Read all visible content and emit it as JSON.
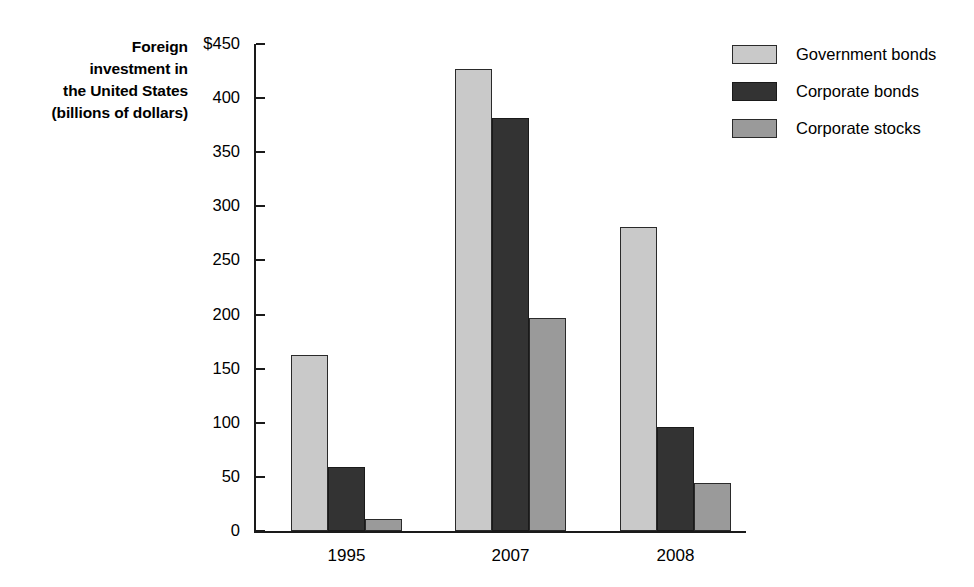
{
  "title": {
    "lines": [
      "Foreign",
      "investment in",
      "the United States",
      "(billions of dollars)"
    ]
  },
  "legend": {
    "position": "top-right",
    "items": [
      {
        "label": "Government bonds",
        "color": "#c9c9c9"
      },
      {
        "label": "Corporate bonds",
        "color": "#333333"
      },
      {
        "label": "Corporate stocks",
        "color": "#9a9a9a"
      }
    ]
  },
  "axis": {
    "y_ticks": [
      "$450",
      "400",
      "350",
      "300",
      "250",
      "200",
      "150",
      "100",
      "50",
      "0"
    ],
    "x_ticks": [
      "1995",
      "2007",
      "2008"
    ]
  },
  "chart_data": {
    "type": "bar",
    "title": "Foreign investment in the United States (billions of dollars)",
    "xlabel": "",
    "ylabel": "billions of dollars",
    "categories": [
      "1995",
      "2007",
      "2008"
    ],
    "series": [
      {
        "name": "Government bonds",
        "color": "#c9c9c9",
        "values": [
          163,
          427,
          281
        ]
      },
      {
        "name": "Corporate bonds",
        "color": "#333333",
        "values": [
          59,
          382,
          96
        ]
      },
      {
        "name": "Corporate stocks",
        "color": "#9a9a9a",
        "values": [
          11,
          197,
          44
        ]
      }
    ],
    "ylim": [
      0,
      450
    ],
    "ytick_step": 50,
    "ytick_values": [
      0,
      50,
      100,
      150,
      200,
      250,
      300,
      350,
      400,
      450
    ],
    "grid": false,
    "legend_position": "top-right"
  }
}
